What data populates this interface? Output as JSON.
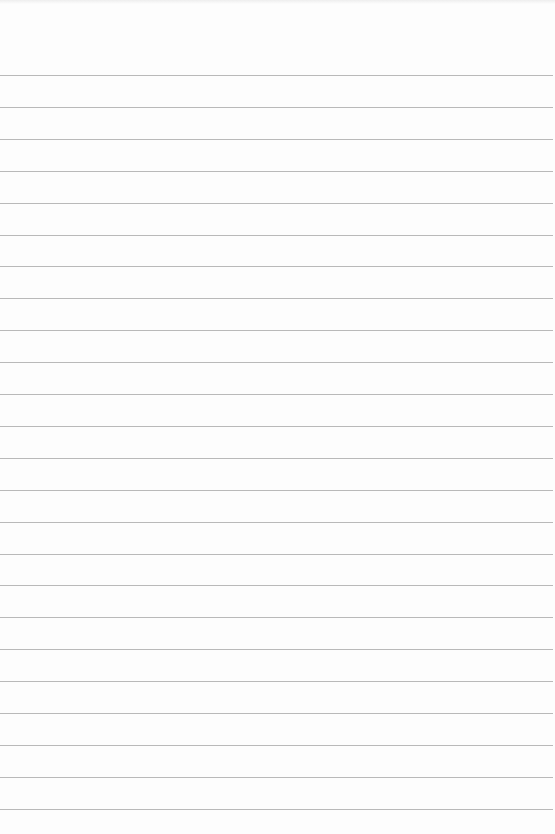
{
  "paper": {
    "type": "lined-notebook-page",
    "background_color": "#fdfdfd",
    "line_color": "#b9b9b9",
    "line_count": 24,
    "first_line_y": 75,
    "line_spacing": 31.9,
    "line_width": 553
  }
}
